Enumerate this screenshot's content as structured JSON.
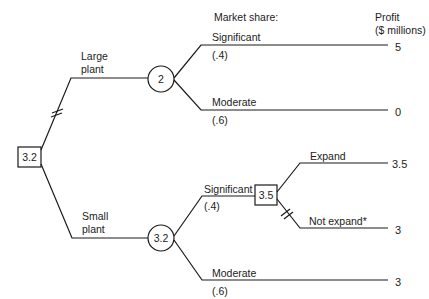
{
  "headers": {
    "market_share": "Market share:",
    "profit_line1": "Profit",
    "profit_line2": "($ millions)"
  },
  "root": {
    "type": "decision",
    "value": "3.2"
  },
  "branches": {
    "large_plant": {
      "label_line1": "Large",
      "label_line2": "plant",
      "pruned": true,
      "chance_node_value": "2",
      "outcomes": [
        {
          "label": "Significant",
          "probability": "(.4)",
          "profit": "5"
        },
        {
          "label": "Moderate",
          "probability": "(.6)",
          "profit": "0"
        }
      ]
    },
    "small_plant": {
      "label_line1": "Small",
      "label_line2": "plant",
      "pruned": false,
      "chance_node_value": "3.2",
      "outcomes": [
        {
          "label": "Significant",
          "probability": "(.4)",
          "decision_node_value": "3.5",
          "choices": [
            {
              "label": "Expand",
              "profit": "3.5",
              "pruned": false
            },
            {
              "label": "Not expand*",
              "profit": "3",
              "pruned": true
            }
          ]
        },
        {
          "label": "Moderate",
          "probability": "(.6)",
          "profit": "3"
        }
      ]
    }
  }
}
